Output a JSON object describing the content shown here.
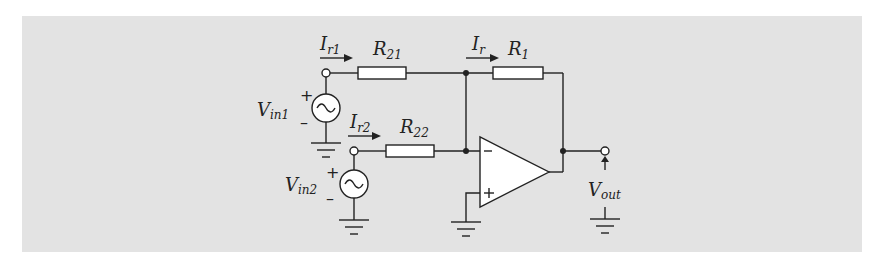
{
  "diagram": {
    "background_color": "#e3e3e3",
    "line_color": "#222222",
    "components": {
      "sources": [
        {
          "id": "vin1",
          "label": "V",
          "label_sub": "in1",
          "plus": "+",
          "minus": "–"
        },
        {
          "id": "vin2",
          "label": "V",
          "label_sub": "in2",
          "plus": "+",
          "minus": "–"
        }
      ],
      "resistors": [
        {
          "id": "r21",
          "label": "R",
          "label_sub": "21"
        },
        {
          "id": "r22",
          "label": "R",
          "label_sub": "22"
        },
        {
          "id": "r1",
          "label": "R",
          "label_sub": "1"
        }
      ],
      "currents": [
        {
          "id": "ir1",
          "label": "I",
          "label_sub": "r1"
        },
        {
          "id": "ir2",
          "label": "I",
          "label_sub": "r2"
        },
        {
          "id": "ir",
          "label": "I",
          "label_sub": "r"
        }
      ],
      "opamp": {
        "minus_label": "–",
        "plus_label": "+"
      },
      "output": {
        "label": "V",
        "label_sub": "out"
      }
    }
  }
}
